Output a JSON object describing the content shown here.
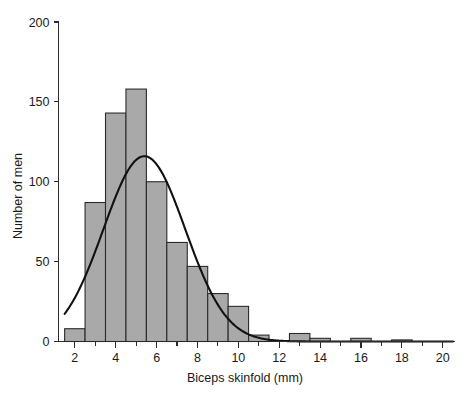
{
  "chart_data": {
    "type": "bar",
    "title": "",
    "subtitle": "",
    "xlabel": "Biceps skinfold (mm)",
    "ylabel": "Number of men",
    "xlim": [
      1.2,
      20.6
    ],
    "ylim": [
      0,
      200
    ],
    "grid": false,
    "legend": null,
    "bin_width": 1,
    "x_tick_values": [
      2,
      4,
      6,
      8,
      10,
      12,
      14,
      16,
      18,
      20
    ],
    "x_tick_labels": [
      "2",
      "4",
      "6",
      "8",
      "10",
      "12",
      "14",
      "16",
      "18",
      "20"
    ],
    "x_minor_tick_values": [
      3,
      5,
      7,
      9,
      11,
      13,
      15,
      17,
      19
    ],
    "y_tick_values": [
      0,
      50,
      100,
      150,
      200
    ],
    "y_tick_labels": [
      "0",
      "50",
      "100",
      "150",
      "200"
    ],
    "bar_fill_color": "#a9a9a9",
    "bar_edge_color": "#2b2b2b",
    "curve_color": "#111111",
    "axis_color": "#2b2b2b",
    "background_color": "#ffffff",
    "bin_edges": [
      1.5,
      2.5,
      3.5,
      4.5,
      5.5,
      6.5,
      7.5,
      8.5,
      9.5,
      10.5,
      11.5,
      12.5,
      13.5,
      14.5,
      15.5,
      16.5,
      17.5,
      18.5,
      19.5,
      20.5
    ],
    "categories": [
      "1.5-2.5",
      "2.5-3.5",
      "3.5-4.5",
      "4.5-5.5",
      "5.5-6.5",
      "6.5-7.5",
      "7.5-8.5",
      "8.5-9.5",
      "9.5-10.5",
      "10.5-11.5",
      "11.5-12.5",
      "12.5-13.5",
      "13.5-14.5",
      "14.5-15.5",
      "15.5-16.5",
      "16.5-17.5",
      "17.5-18.5",
      "18.5-19.5",
      "19.5-20.5"
    ],
    "bin_centers": [
      2,
      3,
      4,
      5,
      6,
      7,
      8,
      9,
      10,
      11,
      12,
      13,
      14,
      15,
      16,
      17,
      18,
      19,
      20
    ],
    "values": [
      8,
      87,
      143,
      158,
      100,
      62,
      47,
      30,
      22,
      4,
      0,
      5,
      2,
      0,
      2,
      0,
      1,
      0,
      0
    ],
    "overlay_curve": {
      "name": "normal density",
      "mean": 5.4,
      "sd": 2.0,
      "peak_value": 116,
      "left_endpoint_x": 1.5,
      "left_endpoint_y": 24,
      "right_endpoint_x": 20.5,
      "right_endpoint_y": 0
    }
  }
}
